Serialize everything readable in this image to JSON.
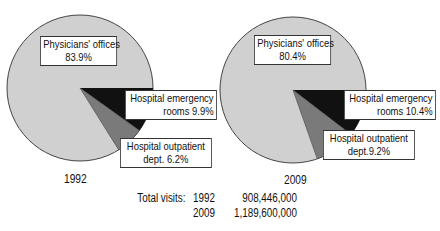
{
  "chart_data": [
    {
      "type": "pie",
      "title": "1992",
      "categories": [
        "Physicians' offices",
        "Hospital emergency rooms",
        "Hospital outpatient dept."
      ],
      "values": [
        83.9,
        9.9,
        6.2
      ],
      "labels": [
        "Physicians' offices",
        "83.9%",
        "Hospital emergency",
        "rooms 9.9%",
        "Hospital outpatient",
        "dept. 6.2%"
      ],
      "colors": [
        "#cfcfcf",
        "#111111",
        "#7a7a7a"
      ]
    },
    {
      "type": "pie",
      "title": "2009",
      "categories": [
        "Physicians' offices",
        "Hospital emergency rooms",
        "Hospital outpatient dept."
      ],
      "values": [
        80.4,
        10.4,
        9.2
      ],
      "labels": [
        "Physicians' offices",
        "80.4%",
        "Hospital emergency",
        "rooms 10.4%",
        "Hospital outpatient",
        "dept.9.2%"
      ],
      "colors": [
        "#cfcfcf",
        "#111111",
        "#7a7a7a"
      ]
    }
  ],
  "pie1": {
    "year": "1992",
    "phys_line1": "Physicians' offices",
    "phys_line2": "83.9%",
    "er_line1": "Hospital emergency",
    "er_line2": "rooms 9.9%",
    "op_line1": "Hospital outpatient",
    "op_line2": "dept. 6.2%"
  },
  "pie2": {
    "year": "2009",
    "phys_line1": "Physicians' offices",
    "phys_line2": "80.4%",
    "er_line1": "Hospital emergency",
    "er_line2": "rooms 10.4%",
    "op_line1": "Hospital outpatient",
    "op_line2": "dept.9.2%"
  },
  "totals": {
    "label": "Total visits:",
    "rows": [
      {
        "year": "1992",
        "value": "908,446,000"
      },
      {
        "year": "2009",
        "value": "1,189,600,000"
      }
    ]
  }
}
